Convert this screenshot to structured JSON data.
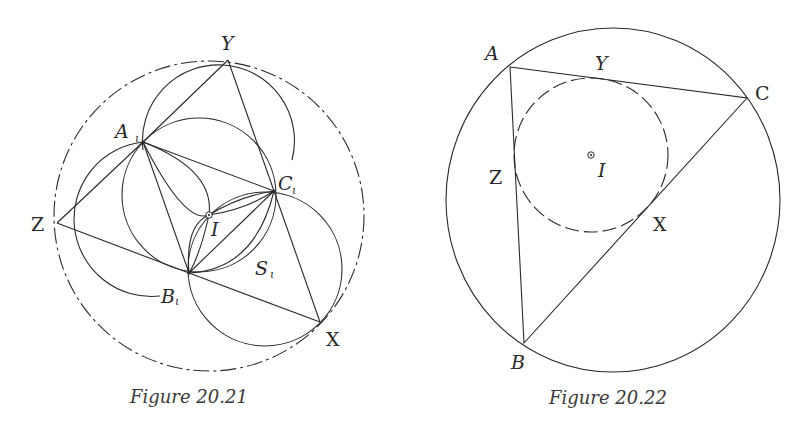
{
  "figures": [
    {
      "caption": "Figure 20.21",
      "labels": {
        "Y": "Y",
        "A": "A",
        "A_sub": "ι",
        "C": "C",
        "C_sub": "ι",
        "Z": "Z",
        "B": "B",
        "B_sub": "ι",
        "I": "I",
        "S": "S",
        "S_sub": "ι",
        "X": "X"
      },
      "points": {
        "Y": [
          228,
          60
        ],
        "A_i": [
          143,
          142
        ],
        "C_i": [
          274,
          191
        ],
        "Z": [
          57,
          223
        ],
        "B_i": [
          189,
          273
        ],
        "X": [
          320,
          322
        ],
        "I": [
          209,
          215
        ]
      }
    },
    {
      "caption": "Figure 20.22",
      "labels": {
        "A": "A",
        "Y": "Y",
        "C": "C",
        "Z": "Z",
        "I": "I",
        "X": "X",
        "B": "B"
      },
      "points": {
        "A": [
          510,
          67
        ],
        "C": [
          747,
          98
        ],
        "B": [
          524,
          343
        ],
        "I": [
          591,
          155
        ]
      }
    }
  ]
}
